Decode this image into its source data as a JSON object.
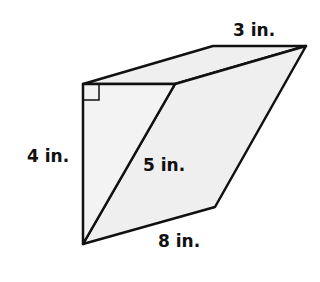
{
  "diagram": {
    "type": "triangular-prism",
    "fill_color": "#efefef",
    "stroke_color": "#111111",
    "labels": {
      "top_edge": "3 in.",
      "left_leg": "4 in.",
      "hypotenuse": "5 in.",
      "bottom_edge": "8 in."
    },
    "right_angle_marker": true
  }
}
